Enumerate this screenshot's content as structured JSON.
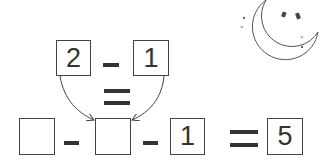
{
  "puzzle": {
    "top": {
      "left_value": "2",
      "operator": "-",
      "right_value": "1"
    },
    "middle_operator": "=",
    "bottom": {
      "box1_value": "",
      "operator1": "-",
      "box2_value": "",
      "operator2": "-",
      "box3_value": "1",
      "equals": "=",
      "result_value": "5"
    }
  },
  "decoration": {
    "icon": "crescent-moon-with-stars"
  }
}
